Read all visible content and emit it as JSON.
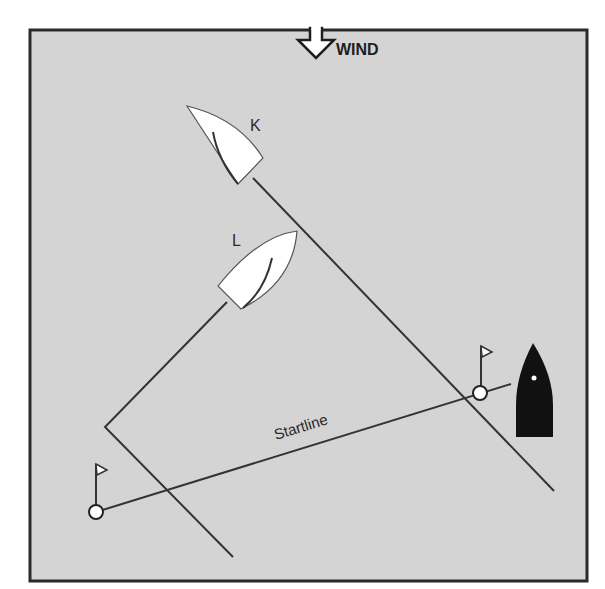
{
  "diagram": {
    "colors": {
      "background": "#d4d4d4",
      "frame": "#2a2a2a",
      "line": "#333333",
      "boat_white": "#ffffff",
      "committee_boat": "#111111"
    },
    "wind": {
      "label": "WIND",
      "icon": "down-arrow-icon"
    },
    "boats": [
      {
        "id": "K",
        "label": "K",
        "color": "white"
      },
      {
        "id": "L",
        "label": "L",
        "color": "white"
      },
      {
        "id": "committee",
        "label": "",
        "color": "black"
      }
    ],
    "startline": {
      "label": "Startline"
    },
    "marks": [
      {
        "id": "left-buoy",
        "icon": "flag-icon"
      },
      {
        "id": "right-buoy",
        "icon": "flag-icon"
      }
    ]
  }
}
